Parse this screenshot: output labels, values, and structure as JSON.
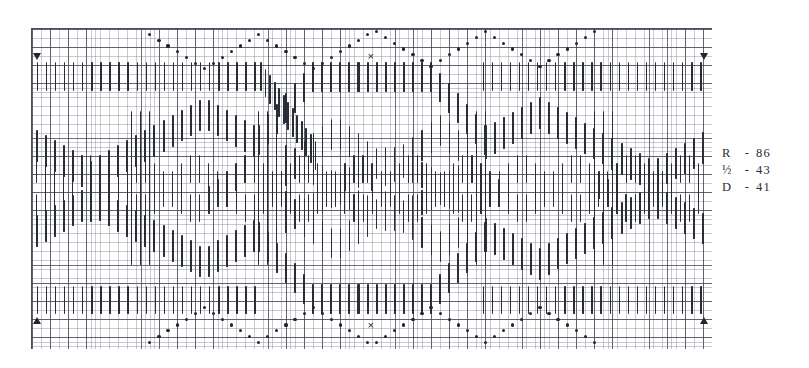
{
  "document": {
    "kind": "needlework-pattern-chart",
    "title": ""
  },
  "legend": {
    "rows": [
      {
        "symbol": "R",
        "dash": "-",
        "value": "86"
      },
      {
        "symbol": "½",
        "dash": "-",
        "value": "43"
      },
      {
        "symbol": "D",
        "dash": "-",
        "value": "41"
      }
    ]
  },
  "markers": {
    "center_x_top": "×",
    "center_x_bottom": "×",
    "corner_top_left": "triangle-down",
    "corner_top_right": "triangle-down",
    "corner_bottom_left": "triangle-up",
    "corner_bottom_right": "triangle-up"
  },
  "colors": {
    "stitch": "#2a2d36",
    "grid_fine": "#787d8c",
    "grid_bold": "#3c4150",
    "paper": "#ffffff",
    "text": "#2a2d36"
  },
  "chart_data": {
    "type": "heatmap",
    "title": "",
    "xlabel": "",
    "ylabel": "",
    "grid": true,
    "legend_position": "right",
    "cell_px": 4.535,
    "bold_every": 4,
    "columns": 150,
    "rows": 70,
    "annotations": [
      {
        "text": "R - 86",
        "where": "legend"
      },
      {
        "text": "½ - 43",
        "where": "legend"
      },
      {
        "text": "D - 41",
        "where": "legend"
      },
      {
        "text": "×",
        "where": "top-center"
      },
      {
        "text": "×",
        "where": "bottom-center"
      }
    ]
  }
}
